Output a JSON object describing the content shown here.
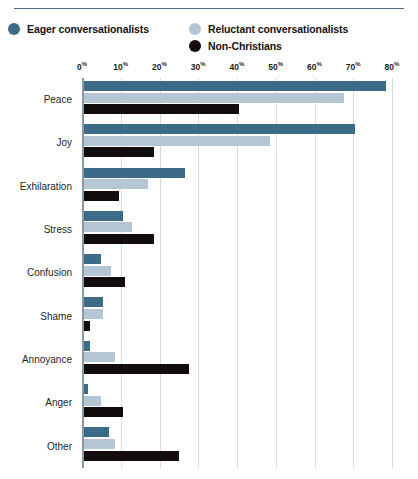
{
  "chart_data": {
    "type": "bar",
    "orientation": "horizontal",
    "title": "",
    "subtitle": "",
    "xlabel": "",
    "ylabel": "",
    "xlim": [
      0,
      80
    ],
    "xticks": [
      0,
      10,
      20,
      30,
      40,
      50,
      60,
      70,
      80
    ],
    "xtick_labels": [
      "0%",
      "10%",
      "20%",
      "30%",
      "40%",
      "50%",
      "60%",
      "70%",
      "80%"
    ],
    "grid": true,
    "grid_axis": "x",
    "legend_position": "top-left",
    "categories": [
      "Peace",
      "Joy",
      "Exhilaration",
      "Stress",
      "Confusion",
      "Shame",
      "Annoyance",
      "Anger",
      "Other"
    ],
    "series": [
      {
        "name": "Eager conversationalists",
        "color": "#3c6b87",
        "values": [
          78,
          70,
          26,
          10,
          4.5,
          5,
          1.5,
          1,
          6.5
        ]
      },
      {
        "name": "Reluctant conversationalists",
        "color": "#b4c6d3",
        "values": [
          67,
          48,
          16.5,
          12.5,
          7,
          5,
          8,
          4.5,
          8
        ]
      },
      {
        "name": "Non-Christians",
        "color": "#120d0c",
        "values": [
          40,
          18,
          9,
          18,
          10.5,
          1.5,
          27,
          10,
          24.5
        ]
      }
    ]
  },
  "legend": {
    "items": [
      {
        "label": "Eager conversationalists",
        "color": "#3c6b87"
      },
      {
        "label": "Reluctant conversationalists",
        "color": "#b4c6d3"
      },
      {
        "label": "Non-Christians",
        "color": "#120d0c"
      }
    ]
  },
  "colors": {
    "eager": "#3c6b87",
    "reluctant": "#b4c6d3",
    "non_christians": "#120d0c",
    "rule": "#4a6b80",
    "gridline": "#d6dde2",
    "axis": "#8a9aa5",
    "text": "#1a1a1a",
    "background": "#ffffff"
  }
}
